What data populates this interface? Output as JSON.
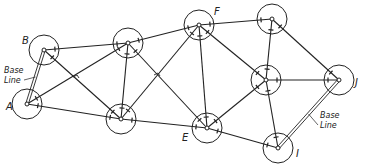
{
  "diagram": {
    "colors": {
      "line": "#222222",
      "background": "#ffffff"
    },
    "station_radius": 15,
    "stations": [
      {
        "id": "A",
        "label": "A",
        "x": 27,
        "y": 104,
        "lx": 6,
        "ly": 110
      },
      {
        "id": "B",
        "label": "B",
        "x": 44,
        "y": 50,
        "lx": 22,
        "ly": 44
      },
      {
        "id": "C",
        "label": "",
        "x": 128,
        "y": 43
      },
      {
        "id": "D",
        "label": "",
        "x": 121,
        "y": 119
      },
      {
        "id": "E",
        "label": "E",
        "x": 207,
        "y": 128,
        "lx": 182,
        "ly": 141
      },
      {
        "id": "F",
        "label": "F",
        "x": 199,
        "y": 25,
        "lx": 214,
        "ly": 15
      },
      {
        "id": "G",
        "label": "",
        "x": 272,
        "y": 19
      },
      {
        "id": "H",
        "label": "",
        "x": 266,
        "y": 80
      },
      {
        "id": "I",
        "label": "I",
        "x": 278,
        "y": 148,
        "lx": 296,
        "ly": 157
      },
      {
        "id": "J",
        "label": "J",
        "x": 339,
        "y": 80,
        "lx": 355,
        "ly": 86
      }
    ],
    "edges": [
      [
        "B",
        "C"
      ],
      [
        "B",
        "D"
      ],
      [
        "A",
        "C"
      ],
      [
        "A",
        "D"
      ],
      [
        "C",
        "F"
      ],
      [
        "C",
        "D"
      ],
      [
        "C",
        "E"
      ],
      [
        "D",
        "F"
      ],
      [
        "D",
        "E"
      ],
      [
        "F",
        "G"
      ],
      [
        "F",
        "E"
      ],
      [
        "F",
        "H"
      ],
      [
        "G",
        "H"
      ],
      [
        "G",
        "J"
      ],
      [
        "H",
        "J"
      ],
      [
        "H",
        "E"
      ],
      [
        "H",
        "I"
      ],
      [
        "E",
        "I"
      ]
    ],
    "base_lines": [
      {
        "from": "A",
        "to": "B",
        "label_line1": "Base",
        "label_line2": "Line",
        "tx": 4,
        "ty": 73
      },
      {
        "from": "I",
        "to": "J",
        "label_line1": "Base",
        "label_line2": "Line",
        "tx": 320,
        "ty": 118
      }
    ]
  }
}
